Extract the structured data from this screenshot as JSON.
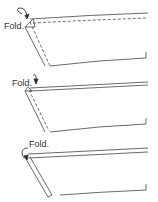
{
  "steps": [
    {
      "label": "Fold.",
      "description": "Fold corner up diagonally (dashed fold lines)"
    },
    {
      "label": "Fold.",
      "description": "Fold top edge down"
    },
    {
      "label": "Fold.",
      "description": "Fold over again toward the back"
    }
  ],
  "colors": {
    "line": "#444444",
    "background": "#ffffff"
  }
}
